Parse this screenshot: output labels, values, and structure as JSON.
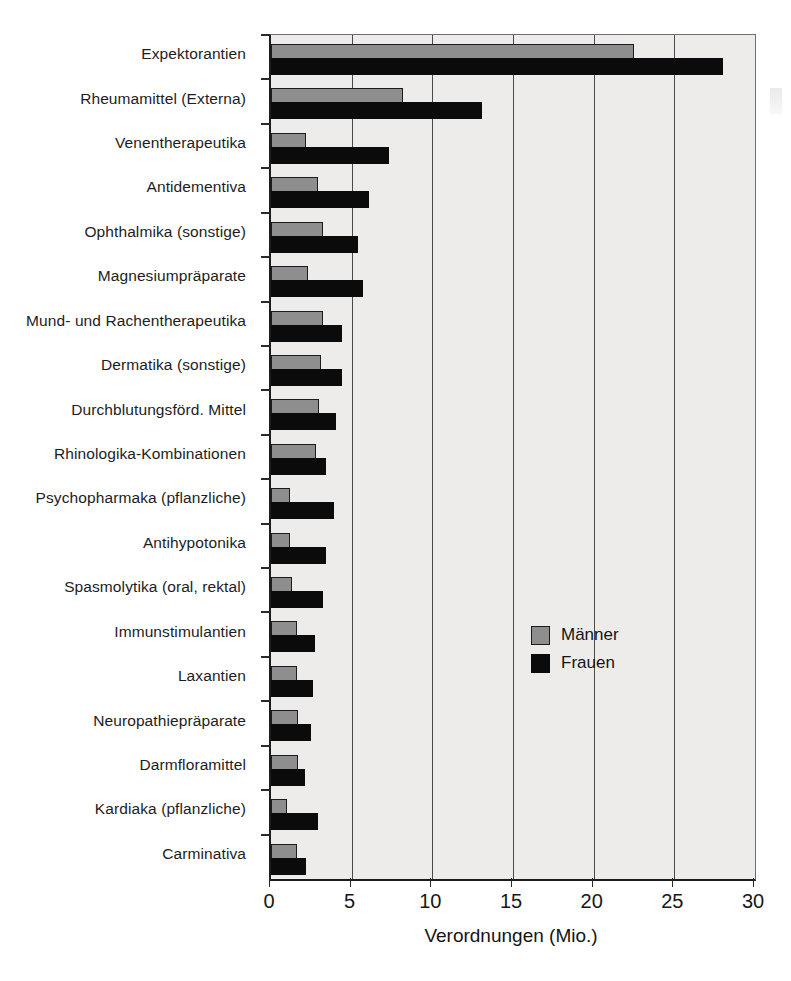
{
  "chart_data": {
    "type": "bar",
    "orientation": "horizontal",
    "title": "",
    "xlabel": "Verordnungen (Mio.)",
    "ylabel": "",
    "xlim": [
      0,
      30
    ],
    "xticks": [
      0,
      5,
      10,
      15,
      20,
      25,
      30
    ],
    "xtick_labels": [
      "0",
      "5",
      "10",
      "15",
      "20",
      "25",
      "30"
    ],
    "grid": true,
    "grid_axis": "x",
    "legend_position": "center-right",
    "categories": [
      "Expektorantien",
      "Rheumamittel (Externa)",
      "Venentherapeutika",
      "Antidementiva",
      "Ophthalmika (sonstige)",
      "Magnesiumpräparate",
      "Mund- und Rachentherapeutika",
      "Dermatika (sonstige)",
      "Durchblutungsförd. Mittel",
      "Rhinologika-Kombinationen",
      "Psychopharmaka (pflanzliche)",
      "Antihypotonika",
      "Spasmolytika (oral, rektal)",
      "Immunstimulantien",
      "Laxantien",
      "Neuropathiepräparate",
      "Darmfloramittel",
      "Kardiaka (pflanzliche)",
      "Carminativa"
    ],
    "series": [
      {
        "name": "Männer",
        "color": "#8e8e8e",
        "values": [
          22.5,
          8.2,
          2.2,
          2.9,
          3.2,
          2.3,
          3.2,
          3.1,
          3.0,
          2.8,
          1.2,
          1.2,
          1.3,
          1.6,
          1.6,
          1.7,
          1.7,
          1.0,
          1.6
        ]
      },
      {
        "name": "Frauen",
        "color": "#0b0b0b",
        "values": [
          28.0,
          13.1,
          7.3,
          6.1,
          5.4,
          5.7,
          4.4,
          4.4,
          4.0,
          3.4,
          3.9,
          3.4,
          3.2,
          2.7,
          2.6,
          2.5,
          2.1,
          2.9,
          2.2
        ]
      }
    ],
    "legend": [
      {
        "label": "Männer",
        "swatch": "gray"
      },
      {
        "label": "Frauen",
        "swatch": "black"
      }
    ]
  }
}
